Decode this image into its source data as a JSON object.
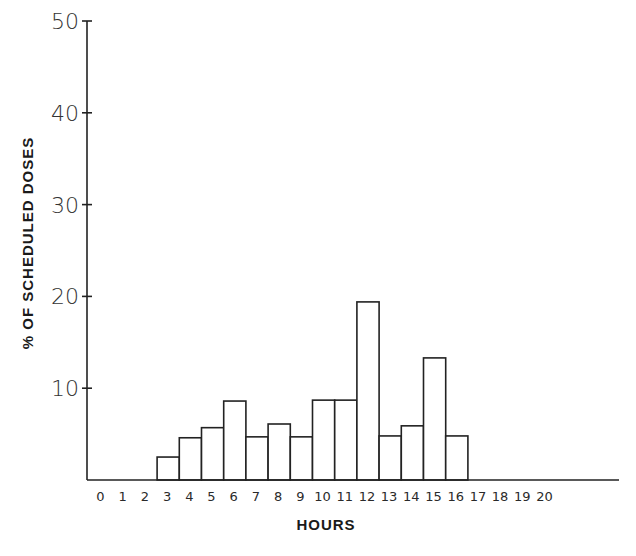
{
  "chart_data": {
    "type": "bar",
    "title": "",
    "xlabel": "HOURS",
    "ylabel": "% OF SCHEDULED DOSES",
    "x_tick_labels": [
      "0",
      "1",
      "2",
      "3",
      "4",
      "5",
      "6",
      "7",
      "8",
      "9",
      "10",
      "11",
      "12",
      "13",
      "14",
      "15",
      "16",
      "17",
      "18",
      "19",
      "20"
    ],
    "y_tick_labels": [
      "10",
      "20",
      "30",
      "40",
      "50"
    ],
    "y_ticks": [
      10,
      20,
      30,
      40,
      50
    ],
    "ylim": [
      0,
      50
    ],
    "xlim": [
      0,
      24
    ],
    "grid": false,
    "legend": null,
    "bar_style": "histogram, white fill, black outline",
    "categories": [
      "3-4",
      "4-5",
      "5-6",
      "6-7",
      "7-8",
      "8-9",
      "9-10",
      "10-11",
      "11-12",
      "12-13",
      "13-14",
      "14-15",
      "15-16",
      "16-17"
    ],
    "bins": [
      {
        "start": 3,
        "end": 4,
        "value": 2.5
      },
      {
        "start": 4,
        "end": 5,
        "value": 4.6
      },
      {
        "start": 5,
        "end": 6,
        "value": 5.7
      },
      {
        "start": 6,
        "end": 7,
        "value": 8.6
      },
      {
        "start": 7,
        "end": 8,
        "value": 4.7
      },
      {
        "start": 8,
        "end": 9,
        "value": 6.1
      },
      {
        "start": 9,
        "end": 10,
        "value": 4.7
      },
      {
        "start": 10,
        "end": 11,
        "value": 8.7
      },
      {
        "start": 11,
        "end": 12,
        "value": 8.7
      },
      {
        "start": 12,
        "end": 13,
        "value": 19.4
      },
      {
        "start": 13,
        "end": 14,
        "value": 4.8
      },
      {
        "start": 14,
        "end": 15,
        "value": 5.9
      },
      {
        "start": 15,
        "end": 16,
        "value": 13.3
      },
      {
        "start": 16,
        "end": 17,
        "value": 4.8
      }
    ],
    "values": [
      2.5,
      4.6,
      5.7,
      8.6,
      4.7,
      6.1,
      4.7,
      8.7,
      8.7,
      19.4,
      4.8,
      5.9,
      13.3,
      4.8
    ]
  },
  "axes": {
    "x_title": "HOURS",
    "y_title": "% OF SCHEDULED DOSES"
  },
  "colors": {
    "bar_fill": "#ffffff",
    "bar_stroke": "#222222",
    "axis": "#222222",
    "background": "#ffffff"
  }
}
